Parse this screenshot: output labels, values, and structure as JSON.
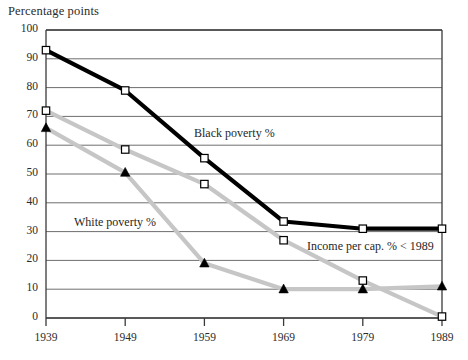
{
  "chart_data": {
    "type": "line",
    "title": "",
    "ylabel": "Percentage points",
    "xlabel": "",
    "categories": [
      "1939",
      "1949",
      "1959",
      "1969",
      "1979",
      "1989"
    ],
    "x": [
      1939,
      1949,
      1959,
      1969,
      1979,
      1989
    ],
    "ylim": [
      0,
      100
    ],
    "xlim": [
      1939,
      1989
    ],
    "yticks": [
      "0",
      "10",
      "20",
      "30",
      "40",
      "50",
      "60",
      "70",
      "80",
      "90",
      "100"
    ],
    "ytick_values": [
      0,
      10,
      20,
      30,
      40,
      50,
      60,
      70,
      80,
      90,
      100
    ],
    "grid": true,
    "grid_axis": "y",
    "legend_position": "inline-annotations",
    "series": [
      {
        "name": "Black poverty %",
        "values": [
          93,
          79,
          55.5,
          33.5,
          31,
          31
        ],
        "color": "#000000",
        "marker": "open-square",
        "line_width": 4.2,
        "annotation": "Black poverty %"
      },
      {
        "name": "White poverty %",
        "values": [
          72,
          58.5,
          46.5,
          27,
          13,
          0.5
        ],
        "color": "#c6c6c6",
        "marker": "open-square",
        "line_width": 4.2,
        "annotation": "White poverty %"
      },
      {
        "name": "Income per cap. % < 1989",
        "values": [
          66,
          50.5,
          19,
          10,
          10,
          11
        ],
        "color": "#c6c6c6",
        "marker": "filled-triangle",
        "line_width": 4.2,
        "annotation": "Income per cap. % < 1989"
      }
    ],
    "annotations": [
      {
        "text": "Black poverty %",
        "x_px": 194,
        "y_px": 126
      },
      {
        "text": "White poverty %",
        "x_px": 74,
        "y_px": 215
      },
      {
        "text": "Income per cap. % < 1989",
        "x_px": 307,
        "y_px": 239
      }
    ],
    "colors": {
      "black_series": "#000000",
      "grey_series": "#c6c6c6",
      "axis": "#3a3a3a",
      "gridline": "#6e6e6e",
      "background": "#ffffff"
    }
  }
}
